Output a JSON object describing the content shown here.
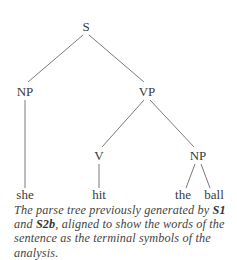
{
  "diagram": {
    "type": "parse-tree",
    "nodes": [
      {
        "id": "S",
        "label": "S",
        "x": 86,
        "y": 28
      },
      {
        "id": "NP1",
        "label": "NP",
        "x": 25,
        "y": 96
      },
      {
        "id": "VP",
        "label": "VP",
        "x": 147,
        "y": 96
      },
      {
        "id": "V",
        "label": "V",
        "x": 99,
        "y": 160
      },
      {
        "id": "NP2",
        "label": "NP",
        "x": 198,
        "y": 160
      },
      {
        "id": "she",
        "label": "she",
        "x": 25,
        "y": 199
      },
      {
        "id": "hit",
        "label": "hit",
        "x": 99,
        "y": 199
      },
      {
        "id": "the",
        "label": "the",
        "x": 183,
        "y": 199
      },
      {
        "id": "ball",
        "label": "ball",
        "x": 214,
        "y": 199
      }
    ],
    "edges": [
      [
        "S",
        "NP1"
      ],
      [
        "S",
        "VP"
      ],
      [
        "NP1",
        "she"
      ],
      [
        "VP",
        "V"
      ],
      [
        "VP",
        "NP2"
      ],
      [
        "V",
        "hit"
      ],
      [
        "NP2",
        "the"
      ],
      [
        "NP2",
        "ball"
      ]
    ]
  },
  "caption": {
    "part1": "The parse tree previously generated by ",
    "ref1": "S1",
    "part2": " and ",
    "ref2": "S2b",
    "part3": ", aligned to show the words of the sentence as the terminal symbols of the analysis."
  }
}
